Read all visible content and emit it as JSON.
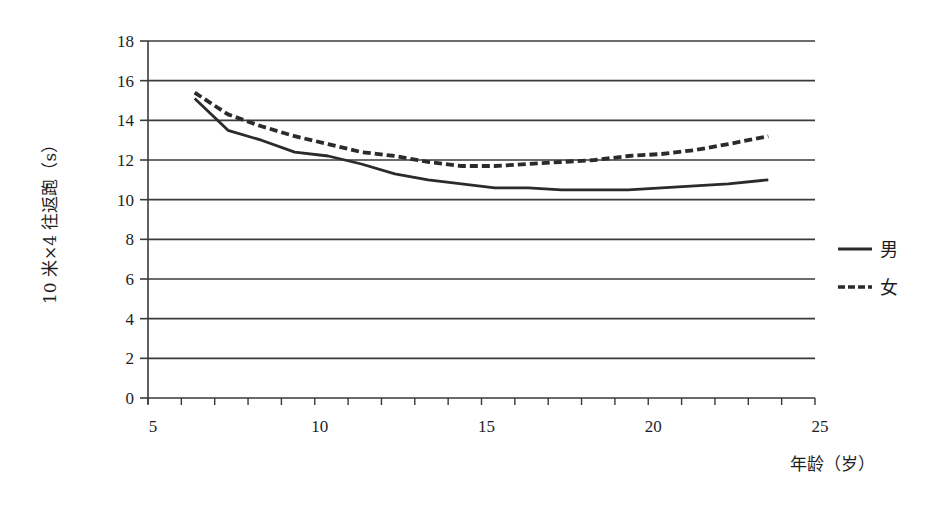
{
  "chart_data": {
    "type": "line",
    "title": "",
    "xlabel": "年龄（岁）",
    "ylabel": "10 米×4 往返跑（s）",
    "xlim": [
      5,
      25
    ],
    "ylim": [
      0,
      18
    ],
    "x_ticks": [
      5,
      10,
      15,
      20,
      25
    ],
    "x_minor_step": 1,
    "y_ticks": [
      0,
      2,
      4,
      6,
      8,
      10,
      12,
      14,
      16,
      18
    ],
    "grid": "horizontal",
    "legend_position": "right",
    "series": [
      {
        "name": "男",
        "style": "solid",
        "color": "#2b2b2b",
        "x": [
          6.4,
          7.4,
          8.4,
          9.4,
          10.4,
          11.4,
          12.4,
          13.4,
          14.4,
          15.4,
          16.4,
          17.4,
          18.4,
          19.4,
          20.4,
          21.4,
          22.4,
          23.6
        ],
        "values": [
          15.1,
          13.5,
          13.0,
          12.4,
          12.2,
          11.8,
          11.3,
          11.0,
          10.8,
          10.6,
          10.6,
          10.5,
          10.5,
          10.5,
          10.6,
          10.7,
          10.8,
          11.0
        ]
      },
      {
        "name": "女",
        "style": "dashed",
        "color": "#2b2b2b",
        "x": [
          6.4,
          7.4,
          8.4,
          9.4,
          10.4,
          11.4,
          12.4,
          13.4,
          14.4,
          15.4,
          16.4,
          17.4,
          18.4,
          19.4,
          20.4,
          21.4,
          22.4,
          23.6
        ],
        "values": [
          15.4,
          14.3,
          13.7,
          13.2,
          12.8,
          12.4,
          12.2,
          11.9,
          11.7,
          11.7,
          11.8,
          11.9,
          12.0,
          12.2,
          12.3,
          12.5,
          12.8,
          13.2
        ]
      }
    ]
  }
}
